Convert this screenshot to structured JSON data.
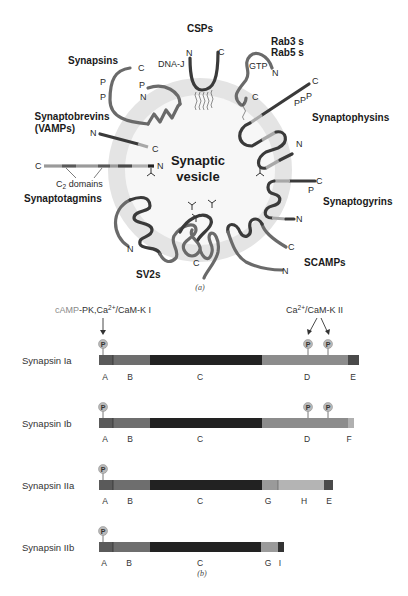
{
  "panel_a": {
    "caption": "(a)",
    "vesicle_label_line1": "Synaptic",
    "vesicle_label_line2": "vesicle",
    "proteins": {
      "synapsins": {
        "label": "Synapsins",
        "termini": [
          "C",
          "N"
        ],
        "phospho": [
          "P",
          "P",
          "P"
        ]
      },
      "csps": {
        "label": "CSPs",
        "domain": "DNA-J",
        "termini": [
          "N",
          "C"
        ]
      },
      "rab": {
        "label_line1": "Rab3 s",
        "label_line2": "Rab5 s",
        "bound": "GTP",
        "termini": [
          "N",
          "C"
        ]
      },
      "synaptobrevins": {
        "label_line1": "Synaptobrevins",
        "label_line2": "(VAMPs)",
        "termini": [
          "N",
          "C"
        ]
      },
      "synaptophysins": {
        "label": "Synaptophysins",
        "termini": [
          "C",
          "N"
        ],
        "phospho": [
          "P",
          "P",
          "P"
        ]
      },
      "synaptotagmins": {
        "label": "Synaptotagmins",
        "termini": [
          "C",
          "N"
        ],
        "domain_label": "C",
        "domain_sub": "2",
        "domain_suffix": " domains"
      },
      "synaptogyrins": {
        "label": "Synaptogyrins",
        "termini": [
          "C",
          "N"
        ],
        "phospho": [
          "P"
        ]
      },
      "sv2s": {
        "label": "SV2s",
        "termini": [
          "N",
          "C"
        ]
      },
      "scamps": {
        "label": "SCAMPs",
        "termini": [
          "C",
          "N"
        ]
      }
    }
  },
  "panel_b": {
    "caption": "(b)",
    "kinase_left": {
      "prefix": "cAMP",
      "rest": "-PK,Ca",
      "sup": "2+",
      "suffix": "/CaM-K I"
    },
    "kinase_right": {
      "prefix": "Ca",
      "sup": "2+",
      "suffix": "/CaM-K II"
    },
    "phospho_label": "P",
    "isoforms": [
      {
        "name": "Synapsin Ia",
        "domains": [
          "A",
          "B",
          "C",
          "D",
          "E"
        ]
      },
      {
        "name": "Synapsin Ib",
        "domains": [
          "A",
          "B",
          "C",
          "D",
          "F"
        ]
      },
      {
        "name": "Synapsin IIa",
        "domains": [
          "A",
          "B",
          "C",
          "G",
          "H",
          "E"
        ]
      },
      {
        "name": "Synapsin IIb",
        "domains": [
          "A",
          "B",
          "C",
          "G",
          "I"
        ]
      }
    ]
  },
  "colors": {
    "domain_A": "#5a5a5a",
    "domain_B": "#6e6e6e",
    "domain_C": "#222222",
    "domain_D": "#8c8c8c",
    "domain_E": "#4a4a4a",
    "domain_F": "#b0b0b0",
    "domain_G": "#9a9a9a",
    "domain_H": "#b4b4b4",
    "domain_I": "#333333",
    "vesicle_membrane": "#e3e3e3",
    "phospho_ball": "#b8b8b8"
  }
}
